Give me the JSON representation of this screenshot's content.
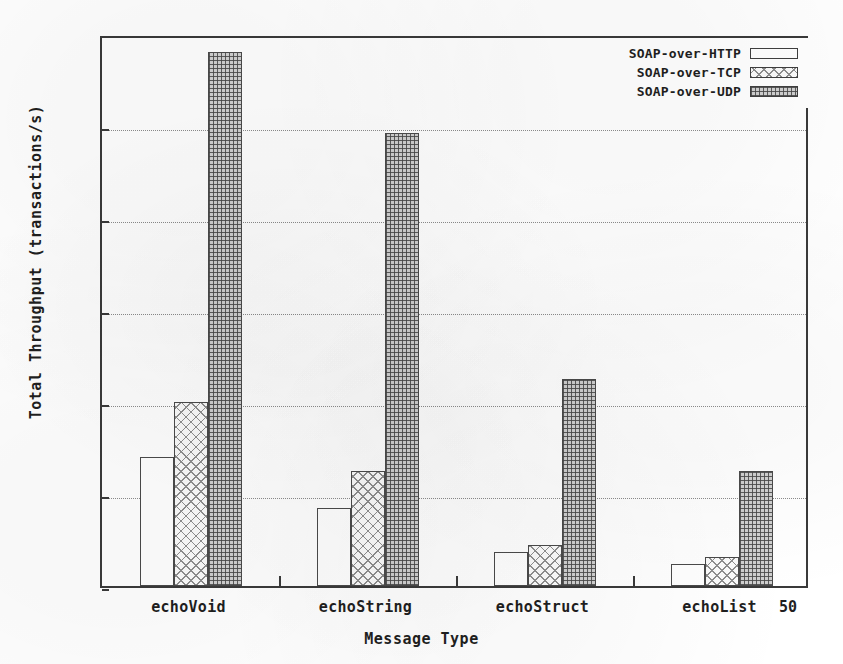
{
  "chart_data": {
    "type": "bar",
    "title": "",
    "xlabel": "Message Type",
    "ylabel": "Total Throughput (transactions/s)",
    "categories": [
      "echoVoid",
      "echoString",
      "echoStruct",
      "echoList"
    ],
    "series": [
      {
        "name": "SOAP-over-HTTP",
        "pattern": "plain",
        "values": [
          2.8,
          1.7,
          0.75,
          0.47
        ]
      },
      {
        "name": "SOAP-over-TCP",
        "pattern": "crosshatch",
        "values": [
          4.0,
          2.5,
          0.9,
          0.62
        ]
      },
      {
        "name": "SOAP-over-UDP",
        "pattern": "dotted",
        "values": [
          11.6,
          9.85,
          4.5,
          2.5
        ]
      }
    ],
    "ylim": [
      0,
      12
    ],
    "yticks": [
      0,
      2,
      4,
      6,
      8,
      10,
      12
    ],
    "ytick_labels": [
      "0",
      "2",
      "4",
      "6",
      "8",
      "10",
      "12"
    ],
    "grid": true,
    "legend_position": "top-right"
  },
  "axis": {
    "y_title": "Total Throughput (transactions/s)",
    "x_title": "Message Type"
  },
  "legend": {
    "items": [
      {
        "label": "SOAP-over-HTTP"
      },
      {
        "label": "SOAP-over-TCP"
      },
      {
        "label": "SOAP-over-UDP"
      }
    ]
  },
  "artifacts": {
    "page_number": "50"
  }
}
